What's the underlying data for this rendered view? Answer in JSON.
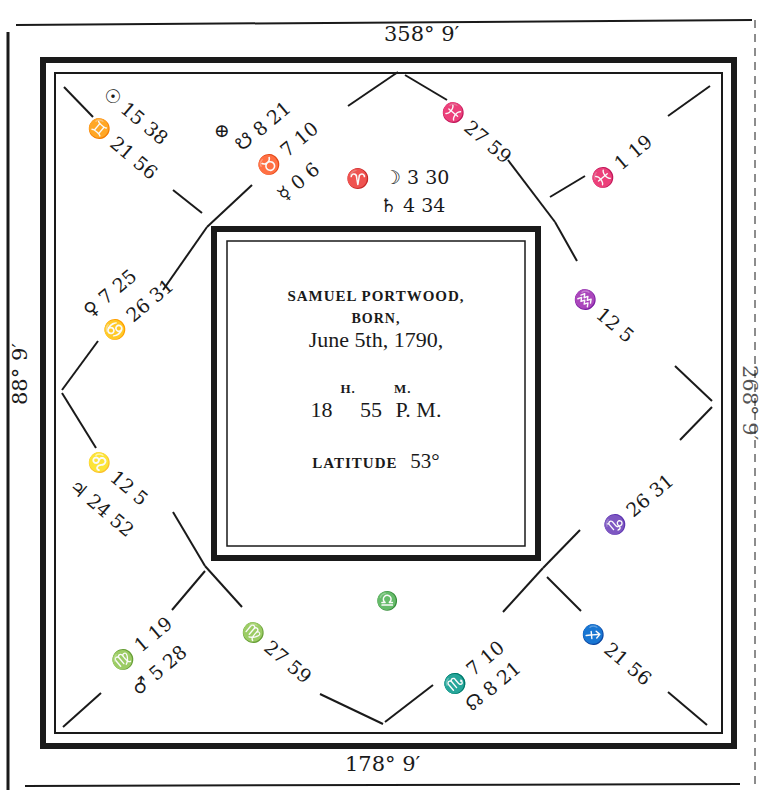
{
  "chart_title": "Horoscope of Samuel Portwood",
  "cusps": {
    "top": "358° 9′",
    "bottom": "178° 9′",
    "left": "88° 9′",
    "right": "268° 9′"
  },
  "center": {
    "name": "SAMUEL PORTWOOD,",
    "born": "BORN,",
    "date": "June 5th, 1790,",
    "hours_label": "H.",
    "minutes_label": "M.",
    "hours": "18",
    "minutes": "55",
    "ampm": "P. M.",
    "latitude_label": "LATITUDE",
    "latitude_value": "53°"
  },
  "houses": {
    "h12_line1": "☉ 15 38",
    "h12_line2": "♊ 21 56",
    "h11_fortune": "⊕",
    "h11_line1": "☋ 8 21",
    "h11_line2": "♉ 7 10",
    "h11_line3": "☿ 0  6",
    "h10_sign": "♈",
    "h10_line1": "☽ 3 30",
    "h10_line2": "♄ 4 34",
    "h9_line1": "♓ 27 59",
    "h8_line1": "♓ 1 19",
    "h1_line1": "♀ 7 25",
    "h1_line2": "♋ 26 31",
    "h7_line1": "♒ 12 5",
    "h2_line1": "♌ 12 5",
    "h2_line2": "♃ 24 52",
    "h6_line1": "♑ 26 31",
    "h3_line1": "♍ 1 19",
    "h3_line2": "♂ 5 28",
    "h4_line1": "♍ 27 59",
    "h4_sign": "♎",
    "h5_line1": "♏ 7 10",
    "h5_line2": "☊ 8 21",
    "h5b_line1": "♐ 21 56"
  }
}
